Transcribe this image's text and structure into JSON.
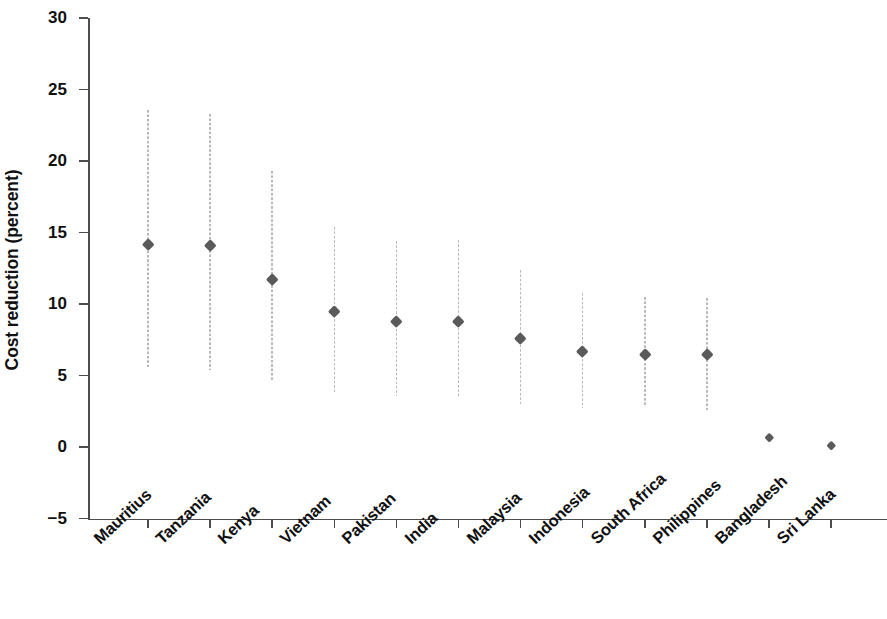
{
  "chart_data": {
    "type": "scatter",
    "title": "",
    "xlabel": "",
    "ylabel": "Cost reduction (percent)",
    "ylim": [
      -5,
      30
    ],
    "yticks": [
      30,
      25,
      20,
      15,
      10,
      5,
      0,
      -5
    ],
    "ytick_labels": [
      "30",
      "25",
      "20",
      "15",
      "10",
      "5",
      "0",
      "−5"
    ],
    "grid": false,
    "legend": null,
    "error_bars": "vertical dotted range lines (confidence interval)",
    "marker_style": "diamond",
    "marker_color": "#5a5a5a",
    "errorbar_color": "#b9b9b9",
    "axis_color": "#4d4d4d",
    "categories": [
      "Mauritius",
      "Tanzania",
      "Kenya",
      "Vietnam",
      "Pakistan",
      "India",
      "Malaysia",
      "Indonesia",
      "South Africa",
      "Philippines",
      "Bangladesh",
      "Sri Lanka"
    ],
    "values": [
      14.2,
      14.1,
      11.7,
      9.5,
      8.8,
      8.8,
      7.6,
      6.7,
      6.5,
      6.5,
      0.7,
      0.1
    ],
    "ci_low": [
      5.6,
      5.4,
      4.6,
      3.8,
      3.6,
      3.5,
      3.0,
      2.7,
      2.8,
      2.6,
      null,
      null
    ],
    "ci_high": [
      23.6,
      23.3,
      19.3,
      15.4,
      14.4,
      14.5,
      12.4,
      10.8,
      10.5,
      10.4,
      null,
      null
    ],
    "points": [
      {
        "category": "Mauritius",
        "value": 14.2,
        "ci_low": 5.6,
        "ci_high": 23.6
      },
      {
        "category": "Tanzania",
        "value": 14.1,
        "ci_low": 5.4,
        "ci_high": 23.3
      },
      {
        "category": "Kenya",
        "value": 11.7,
        "ci_low": 4.6,
        "ci_high": 19.3
      },
      {
        "category": "Vietnam",
        "value": 9.5,
        "ci_low": 3.8,
        "ci_high": 15.4
      },
      {
        "category": "Pakistan",
        "value": 8.8,
        "ci_low": 3.6,
        "ci_high": 14.4
      },
      {
        "category": "India",
        "value": 8.8,
        "ci_low": 3.5,
        "ci_high": 14.5
      },
      {
        "category": "Malaysia",
        "value": 7.6,
        "ci_low": 3.0,
        "ci_high": 12.4
      },
      {
        "category": "Indonesia",
        "value": 6.7,
        "ci_low": 2.7,
        "ci_high": 10.8
      },
      {
        "category": "South Africa",
        "value": 6.5,
        "ci_low": 2.8,
        "ci_high": 10.5
      },
      {
        "category": "Philippines",
        "value": 6.5,
        "ci_low": 2.6,
        "ci_high": 10.4
      },
      {
        "category": "Bangladesh",
        "value": 0.7,
        "ci_low": null,
        "ci_high": null
      },
      {
        "category": "Sri Lanka",
        "value": 0.1,
        "ci_low": null,
        "ci_high": null
      }
    ]
  }
}
